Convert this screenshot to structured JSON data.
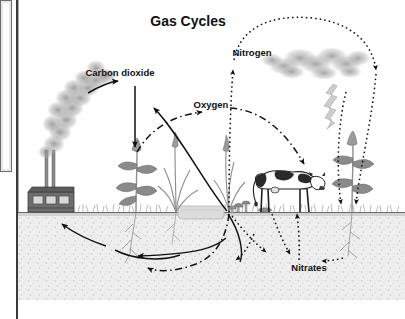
{
  "page": {
    "background": "#ffffff",
    "frame_color": "#3a3a3a",
    "panel_border": "#555555"
  },
  "title": {
    "text": "Gas Cycles",
    "x": 188,
    "y": 26,
    "size": 14,
    "color": "#101010"
  },
  "labels": [
    {
      "name": "carbon-dioxide-label",
      "text": "Carbon dioxide",
      "x": 120,
      "y": 76,
      "size": 9.5,
      "anchor": "middle"
    },
    {
      "name": "oxygen-label",
      "text": "Oxygen",
      "x": 211,
      "y": 108,
      "size": 9.5,
      "anchor": "middle"
    },
    {
      "name": "nitrogen-label",
      "text": "Nitrogen",
      "x": 252,
      "y": 56,
      "size": 9.5,
      "anchor": "middle"
    },
    {
      "name": "nitrates-label",
      "text": "Nitrates",
      "x": 309,
      "y": 271,
      "size": 9.5,
      "anchor": "middle"
    }
  ],
  "colors": {
    "smoke": "#9a9a9a",
    "cloud": "#9d9d9d",
    "soil": "#ededed",
    "soil_speck": "#c9c9c9",
    "grass": "#8e8e8e",
    "plant_stem": "#8b8b8b",
    "leaf": "#7d7d7d",
    "cow_dark": "#2a2a2a",
    "cow_light": "#ffffff",
    "factory": "#6e6e6e",
    "factory_dark": "#4a4a4a",
    "lightning": "#c2c2c2",
    "arrow_solid": "#111111",
    "arrow_dashdot": "#111111",
    "arrow_dotted": "#111111",
    "ground_line": "#6a6a6a",
    "pond": "#d9d9d9"
  },
  "scene": {
    "ground_y": 212,
    "frame": {
      "x": 17,
      "y": 0,
      "w": 388,
      "h": 319
    },
    "left_panel": {
      "x": 0,
      "y": 0,
      "w": 13,
      "h": 172
    },
    "factory": {
      "x": 28,
      "y": 192,
      "w": 46,
      "h": 22,
      "stack_count": 2,
      "window_count": 3
    },
    "smoke_plume": {
      "from": [
        52,
        190
      ],
      "to": [
        118,
        72
      ]
    },
    "cloud": {
      "x": 270,
      "y": 48,
      "w": 96,
      "h": 30
    },
    "lightning_bolt": {
      "x": 330,
      "y": 86,
      "h": 48
    },
    "cow": {
      "x": 255,
      "y": 170,
      "w": 62,
      "h": 46,
      "facing": "right"
    },
    "plants": [
      {
        "name": "plant-left",
        "x": 136,
        "kind": "leafy"
      },
      {
        "name": "grass-tuft-center",
        "x": 176,
        "kind": "grass"
      },
      {
        "name": "grass-tuft-right",
        "x": 229,
        "kind": "grass"
      },
      {
        "name": "plant-right",
        "x": 352,
        "kind": "leafy"
      }
    ],
    "mushrooms": {
      "x": 238,
      "y": 205,
      "count": 3
    },
    "pond": {
      "x": 178,
      "y": 206,
      "w": 46,
      "h": 10
    }
  },
  "cycle_arrows": [
    {
      "name": "arrow-co2-to-plume",
      "style": "solid",
      "desc": "smoke plume to Carbon dioxide label"
    },
    {
      "name": "arrow-co2-down-to-plant",
      "style": "solid",
      "desc": "Carbon dioxide down into plant"
    },
    {
      "name": "arrow-plant-up-left",
      "style": "solid",
      "desc": "plant up-left (carbon release)"
    },
    {
      "name": "arrow-oxygen-right",
      "style": "dash-dot",
      "desc": "Oxygen arc to the right"
    },
    {
      "name": "arrow-oxygen-arc-down",
      "style": "dash-dot",
      "desc": "Oxygen arc down to cow area"
    },
    {
      "name": "arrow-soil-to-factory",
      "style": "solid",
      "desc": "underground arc left to factory"
    },
    {
      "name": "arrow-soil-to-root",
      "style": "solid",
      "desc": "underground arc right to root"
    },
    {
      "name": "arrow-soil-dashdot",
      "style": "dash-dot",
      "desc": "underground dash-dot return arc"
    },
    {
      "name": "arrow-nitrogen-up",
      "style": "dotted",
      "desc": "soil up to Nitrogen"
    },
    {
      "name": "arrow-nitrogen-loop",
      "style": "dotted",
      "desc": "Nitrogen loop over cloud to right"
    },
    {
      "name": "arrow-nitrogen-down-1",
      "style": "dotted",
      "desc": "right descending arrow to ground"
    },
    {
      "name": "arrow-nitrogen-down-2",
      "style": "dotted",
      "desc": "right descending arrow to ground"
    },
    {
      "name": "arrow-nitrates-up",
      "style": "dotted",
      "desc": "Nitrates up to cow/ground"
    },
    {
      "name": "arrow-nitrates-left",
      "style": "dotted",
      "desc": "to Nitrates from upper left"
    },
    {
      "name": "arrow-nitrates-right",
      "style": "dotted",
      "desc": "Nitrates right to plant root"
    }
  ]
}
